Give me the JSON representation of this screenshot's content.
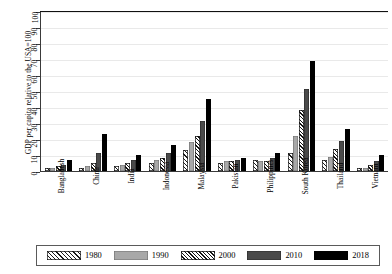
{
  "chart_data": {
    "type": "bar",
    "title": "",
    "subtitle": "",
    "xlabel": "",
    "ylabel": "GDP per capita relative to the USA=100",
    "ylim": [
      0,
      100
    ],
    "yticks": [
      0,
      10,
      20,
      30,
      40,
      50,
      60,
      70,
      80,
      90,
      100
    ],
    "grid": true,
    "legend_position": "bottom",
    "categories": [
      "Bangladesh",
      "China",
      "India",
      "Indonesia",
      "Malaysia",
      "Pakistan",
      "Philippines",
      "South Korea",
      "Thailand",
      "Vietnam"
    ],
    "series": [
      {
        "name": "1980",
        "values": [
          2,
          2,
          3,
          5,
          13,
          5,
          7,
          11,
          7,
          2
        ]
      },
      {
        "name": "1990",
        "values": [
          2,
          3,
          4,
          7,
          18,
          6,
          6,
          22,
          9,
          2
        ]
      },
      {
        "name": "2000",
        "values": [
          3,
          5,
          5,
          8,
          22,
          6,
          6,
          38,
          14,
          4
        ]
      },
      {
        "name": "2010",
        "values": [
          4,
          11,
          7,
          11,
          31,
          7,
          8,
          51,
          19,
          6
        ]
      },
      {
        "name": "2018",
        "values": [
          7,
          23,
          10,
          16,
          45,
          8,
          11,
          69,
          26,
          10
        ]
      }
    ]
  },
  "legend": {
    "items": [
      {
        "label": "1980",
        "swatch": "hatch-light"
      },
      {
        "label": "1990",
        "swatch": "gray-medium"
      },
      {
        "label": "2000",
        "swatch": "hatch-dense"
      },
      {
        "label": "2010",
        "swatch": "gray-dark"
      },
      {
        "label": "2018",
        "swatch": "black-solid"
      }
    ]
  },
  "colors": {
    "series_1980": "#ffffff",
    "series_1990": "#a8a8a8",
    "series_2000": "#ffffff",
    "series_2010": "#4a4a4a",
    "series_2018": "#000000",
    "axis": "#3a3a3a",
    "grid": "#e9e9e9"
  }
}
